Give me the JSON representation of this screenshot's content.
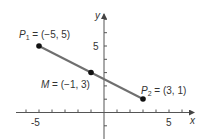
{
  "chart_data": {
    "type": "scatter",
    "title": "",
    "xlabel": "x",
    "ylabel": "y",
    "xlim": [
      -6,
      6
    ],
    "ylim": [
      -2,
      7
    ],
    "x_tick_labels": [
      "-5",
      "5"
    ],
    "y_tick_labels": [
      "5"
    ],
    "grid": false,
    "points": [
      {
        "name": "P1",
        "label_main": "P",
        "label_sub": "1",
        "label_rest": " = (−5, 5)",
        "x": -5,
        "y": 5
      },
      {
        "name": "M",
        "label_main": "M",
        "label_sub": "",
        "label_rest": " = (−1, 3)",
        "x": -1,
        "y": 3
      },
      {
        "name": "P2",
        "label_main": "P",
        "label_sub": "2",
        "label_rest": " = (3, 1)",
        "x": 3,
        "y": 1
      }
    ],
    "segment": {
      "from": "P1",
      "to": "P2",
      "color": "#6b6b6b"
    },
    "annotations": [
      "P1 = (-5, 5)",
      "M = (-1, 3)",
      "P2 = (3, 1)"
    ]
  },
  "colors": {
    "axis": "#555555",
    "segment": "#707070",
    "point": "#111111",
    "text": "#333333"
  }
}
